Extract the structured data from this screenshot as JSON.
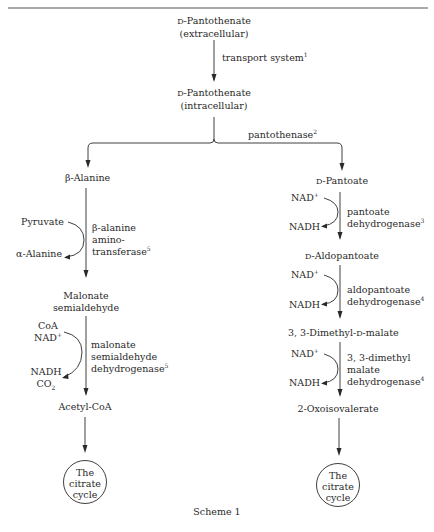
{
  "diagram": {
    "caption": "Scheme 1",
    "top": {
      "extracellular": {
        "prefix": "D",
        "name": "-Pantothenate",
        "location": "(extracellular)"
      },
      "transport": {
        "label": "transport system",
        "ref": "1"
      },
      "intracellular": {
        "prefix": "D",
        "name": "-Pantothenate",
        "location": "(intracellular)"
      },
      "split_enzyme": {
        "label": "pantothenase",
        "ref": "2"
      }
    },
    "left_branch": {
      "start": {
        "prefix": "β",
        "name": "-Alanine"
      },
      "step1": {
        "enzyme_lines": [
          "β-alanine",
          "amino-",
          "transferase"
        ],
        "ref": "5",
        "cosubstrate_in": "Pyruvate",
        "coproduct_out": "α-Alanine"
      },
      "intermediate1": [
        "Malonate",
        "semialdehyde"
      ],
      "step2": {
        "enzyme_lines": [
          "malonate",
          "semialdehyde",
          "dehydrogenase"
        ],
        "ref": "5",
        "cosubstrate_in": [
          "CoA",
          "NAD"
        ],
        "cosubstrate_in_sup": "+",
        "coproduct_out": [
          "NADH",
          "CO"
        ],
        "coproduct_sub": "2"
      },
      "product": "Acetyl-CoA",
      "end": [
        "The",
        "citrate",
        "cycle"
      ]
    },
    "right_branch": {
      "start": {
        "prefix": "D",
        "name": "-Pantoate"
      },
      "step1": {
        "enzyme_lines": [
          "pantoate",
          "dehydrogenase"
        ],
        "ref": "3",
        "cosubstrate_in": "NAD",
        "cosubstrate_in_sup": "+",
        "coproduct_out": "NADH"
      },
      "intermediate1": {
        "prefix": "D",
        "name": "-Aldopantoate"
      },
      "step2": {
        "enzyme_lines": [
          "aldopantoate",
          "dehydrogenase"
        ],
        "ref": "4",
        "cosubstrate_in": "NAD",
        "cosubstrate_in_sup": "+",
        "coproduct_out": "NADH"
      },
      "intermediate2": {
        "name_a": "3, 3-Dimethyl-",
        "prefix": "D",
        "name_b": "-malate"
      },
      "step3": {
        "enzyme_lines": [
          "3, 3-dimethyl",
          "malate",
          "dehydrogenase"
        ],
        "ref": "4",
        "cosubstrate_in": "NAD",
        "cosubstrate_in_sup": "+",
        "coproduct_out": "NADH"
      },
      "product": "2-Oxoisovalerate",
      "end": [
        "The",
        "citrate",
        "cycle"
      ]
    }
  }
}
